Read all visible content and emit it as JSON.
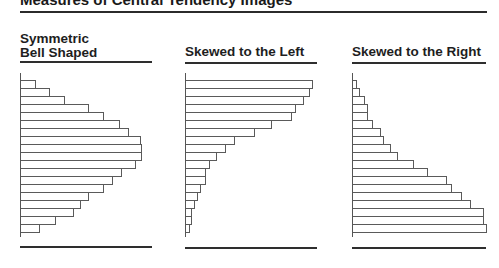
{
  "title": "Measures of Central Tendency Images",
  "colors": {
    "rule": "#2b2b2b",
    "bar_outline": "#5a5a5a",
    "background": "#ffffff",
    "text": "#1a1a1a"
  },
  "panels": [
    {
      "heading_line1": "Symmetric",
      "heading_line2": "Bell Shaped"
    },
    {
      "heading_line1": "",
      "heading_line2": "Skewed to the Left"
    },
    {
      "heading_line1": "",
      "heading_line2": "Skewed to the Right"
    }
  ],
  "chart_data": [
    {
      "type": "bar",
      "orientation": "horizontal",
      "title": "Symmetric Bell Shaped",
      "xlabel": "",
      "ylabel": "",
      "grid": false,
      "categories": [
        "1",
        "2",
        "3",
        "4",
        "5",
        "6",
        "7",
        "8",
        "9",
        "10",
        "11",
        "12",
        "13",
        "14",
        "15",
        "16",
        "17",
        "18",
        "19"
      ],
      "values": [
        14,
        28,
        43,
        67,
        82,
        98,
        107,
        119,
        120,
        120,
        114,
        100,
        91,
        82,
        67,
        59,
        52,
        34,
        18
      ]
    },
    {
      "type": "bar",
      "orientation": "horizontal",
      "title": "Skewed to the Left",
      "xlabel": "",
      "ylabel": "",
      "grid": false,
      "categories": [
        "1",
        "2",
        "3",
        "4",
        "5",
        "6",
        "7",
        "8",
        "9",
        "10",
        "11",
        "12",
        "13",
        "14",
        "15",
        "16",
        "17",
        "18",
        "19"
      ],
      "values": [
        126,
        123,
        117,
        109,
        105,
        85,
        68,
        48,
        39,
        30,
        23,
        19,
        19,
        14,
        11,
        8,
        5,
        5,
        3
      ]
    },
    {
      "type": "bar",
      "orientation": "horizontal",
      "title": "Skewed to the Right",
      "xlabel": "",
      "ylabel": "",
      "grid": false,
      "categories": [
        "1",
        "2",
        "3",
        "4",
        "5",
        "6",
        "7",
        "8",
        "9",
        "10",
        "11",
        "12",
        "13",
        "14",
        "15",
        "16",
        "17",
        "18",
        "19"
      ],
      "values": [
        3,
        6,
        11,
        14,
        14,
        19,
        27,
        30,
        37,
        44,
        60,
        74,
        93,
        98,
        108,
        117,
        130,
        130,
        133
      ]
    }
  ]
}
